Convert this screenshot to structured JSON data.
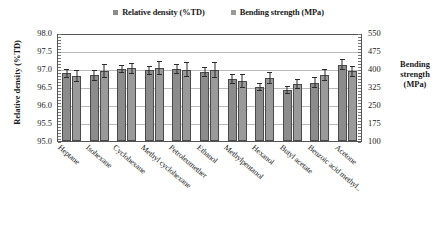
{
  "chart_data": {
    "type": "bar",
    "title": "",
    "xlabel": "",
    "ylabel": "Relative density (%TD)",
    "y2label": "Bending strength (MPa)",
    "grid": true,
    "legend_position": "top-center",
    "ylim": [
      95.0,
      98.0
    ],
    "y2lim": [
      100,
      550
    ],
    "yticks": [
      "98.0",
      "97.5",
      "97.0",
      "96.5",
      "96.0",
      "95.5",
      "95.0"
    ],
    "y2ticks": [
      "550",
      "475",
      "400",
      "325",
      "250",
      "175",
      "100"
    ],
    "categories": [
      "Heptane",
      "Isohexane",
      "Cyclohexane",
      "Methyl cyclohexane",
      "Petroleumether",
      "Ethanol",
      "Methylpentanol",
      "Hexanol",
      "Butyl acetate",
      "Benzoic acid methyl..",
      "Acetone"
    ],
    "series": [
      {
        "name": "Relative density (%TD)",
        "axis": "left",
        "color": "#8c8c8c",
        "values": [
          96.88,
          96.82,
          97.0,
          96.96,
          97.0,
          96.92,
          96.72,
          96.5,
          96.42,
          96.62,
          97.12
        ],
        "errors": [
          0.13,
          0.14,
          0.12,
          0.13,
          0.14,
          0.13,
          0.14,
          0.12,
          0.12,
          0.16,
          0.16
        ]
      },
      {
        "name": "Bending strength (MPa)",
        "axis": "right",
        "color": "#9a9a9a",
        "values": [
          370,
          392,
          403,
          404,
          397,
          396,
          351,
          363,
          338,
          374,
          391
        ],
        "errors": [
          24,
          30,
          24,
          28,
          32,
          33,
          30,
          25,
          22,
          26,
          23
        ]
      }
    ]
  },
  "legend": {
    "entries": [
      {
        "label": "Relative density (%TD)",
        "swatch": "#8c8c8c"
      },
      {
        "label": "Bending strength (MPa)",
        "swatch": "#9a9a9a"
      }
    ]
  },
  "axis_titles": {
    "left": "Relative density (%TD)",
    "right_line1": "Bending",
    "right_line2": "strength",
    "right_line3": "(MPa)"
  }
}
